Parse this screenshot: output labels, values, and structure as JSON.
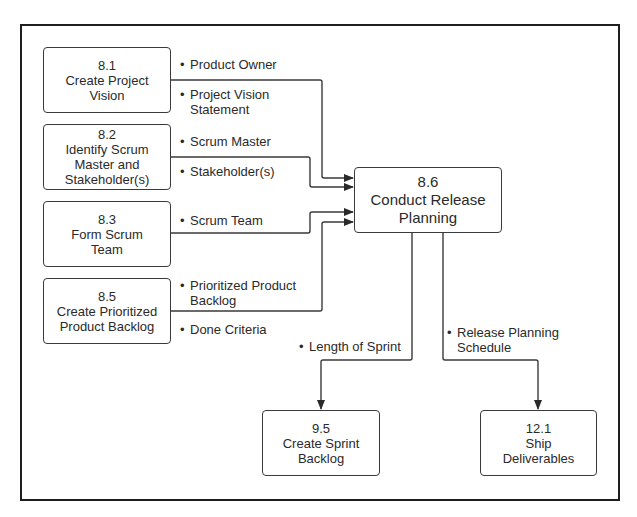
{
  "diagram": {
    "center": {
      "id": "8.6",
      "number": "8.6",
      "title": "Conduct Release Planning",
      "line1": "Conduct Release",
      "line2": "Planning"
    },
    "inputs": [
      {
        "id": "8.1",
        "number": "8.1",
        "line1": "Create Project",
        "line2": "Vision",
        "items": [
          {
            "text": "Product Owner"
          },
          {
            "text": "Project Vision",
            "text2": "Statement"
          }
        ]
      },
      {
        "id": "8.2",
        "number": "8.2",
        "line1": "Identify Scrum",
        "line2": "Master and",
        "line3": "Stakeholder(s)",
        "items": [
          {
            "text": "Scrum Master"
          },
          {
            "text": "Stakeholder(s)"
          }
        ]
      },
      {
        "id": "8.3",
        "number": "8.3",
        "line1": "Form Scrum",
        "line2": "Team",
        "items": [
          {
            "text": "Scrum Team"
          }
        ]
      },
      {
        "id": "8.5",
        "number": "8.5",
        "line1": "Create Prioritized",
        "line2": "Product Backlog",
        "items": [
          {
            "text": "Prioritized Product",
            "text2": "Backlog"
          },
          {
            "text": "Done Criteria"
          }
        ]
      }
    ],
    "outputs": [
      {
        "id": "9.5",
        "number": "9.5",
        "line1": "Create Sprint",
        "line2": "Backlog",
        "items": [
          {
            "text": "Length of Sprint"
          }
        ]
      },
      {
        "id": "12.1",
        "number": "12.1",
        "line1": "Ship",
        "line2": "Deliverables",
        "items": [
          {
            "text": "Release Planning",
            "text2": "Schedule"
          }
        ]
      }
    ],
    "bullet": "•",
    "colors": {
      "line": "#3a3a3a",
      "frame": "#1e1e1e",
      "background": "#ffffff",
      "text": "#2a2a2a"
    }
  }
}
